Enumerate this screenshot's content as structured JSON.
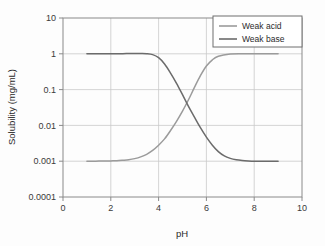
{
  "chart_data": {
    "type": "line",
    "title": "",
    "xlabel": "pH",
    "ylabel": "Solubility (mg/mL)",
    "xlim": [
      0,
      10
    ],
    "ylim": [
      0.0001,
      10
    ],
    "yscale": "log",
    "grid": true,
    "legend_position": "top-right",
    "x_ticks": [
      "0",
      "2",
      "4",
      "6",
      "8",
      "10"
    ],
    "x_tick_values": [
      0,
      2,
      4,
      6,
      8,
      10
    ],
    "y_ticks": [
      "10",
      "1",
      "0.1",
      "0.01",
      "0.001",
      "0.0001"
    ],
    "y_tick_values": [
      10,
      1,
      0.1,
      0.01,
      0.001,
      0.0001
    ],
    "series": [
      {
        "name": "Weak acid",
        "color": "#9b9b9b",
        "x": [
          1.0,
          1.25,
          1.5,
          1.75,
          2.0,
          2.25,
          2.5,
          2.75,
          3.0,
          3.25,
          3.5,
          3.75,
          4.0,
          4.25,
          4.5,
          4.75,
          5.0,
          5.25,
          5.5,
          5.75,
          6.0,
          6.25,
          6.5,
          7.0,
          7.5,
          8.0,
          8.5,
          9.0
        ],
        "y": [
          0.001,
          0.001,
          0.00101,
          0.00101,
          0.00102,
          0.00103,
          0.00106,
          0.0011,
          0.00118,
          0.00132,
          0.00156,
          0.002,
          0.0028,
          0.0042,
          0.0072,
          0.013,
          0.025,
          0.052,
          0.115,
          0.245,
          0.455,
          0.68,
          0.85,
          0.98,
          1.0,
          1.01,
          1.01,
          1.005
        ]
      },
      {
        "name": "Weak base",
        "color": "#6b6b6b",
        "x": [
          1.0,
          1.5,
          2.0,
          2.5,
          2.75,
          3.0,
          3.25,
          3.5,
          3.75,
          4.0,
          4.25,
          4.5,
          4.75,
          5.0,
          5.25,
          5.5,
          5.75,
          6.0,
          6.25,
          6.5,
          6.75,
          7.0,
          7.25,
          7.5,
          7.75,
          8.0,
          8.25,
          8.5,
          9.0
        ],
        "y": [
          1.0,
          1.0,
          1.005,
          1.01,
          1.02,
          1.02,
          1.02,
          1.01,
          0.95,
          0.78,
          0.52,
          0.29,
          0.15,
          0.072,
          0.034,
          0.017,
          0.0086,
          0.0047,
          0.0028,
          0.00185,
          0.0014,
          0.0012,
          0.0011,
          0.00105,
          0.00102,
          0.001,
          0.001,
          0.001,
          0.001
        ]
      }
    ],
    "legend": [
      {
        "label": "Weak acid",
        "color": "#9b9b9b"
      },
      {
        "label": "Weak base",
        "color": "#6b6b6b"
      }
    ],
    "annotations": {
      "crossover_ph": 4.75,
      "crossover_solubility": 0.15
    }
  },
  "figure": {
    "background": "#fdfdfd",
    "frame_color": "#8a8a8a",
    "grid_color": "#c9c9c9"
  }
}
